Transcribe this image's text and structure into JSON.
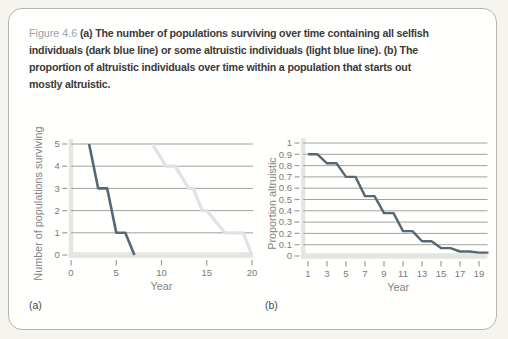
{
  "page": {
    "panel_a_label": "(a)",
    "panel_b_label": "(b)"
  },
  "caption": {
    "figure_label": "Figure 4.6",
    "lines": [
      " (a) The number of populations surviving over time containing all selfish",
      "individuals (dark blue line) or some altruistic individuals (light blue line). (b) The",
      "proportion of altruistic individuals over time within a population that starts out",
      "mostly altruistic."
    ]
  },
  "colors": {
    "page_bg": "#f6f4ee",
    "card_bg": "#fffffe",
    "card_border": "#b6b4ac",
    "caption_label": "#93a5ae",
    "caption_text": "#3b3a38",
    "dark_line": "#566874",
    "light_line": "#dde4e9",
    "grid": "#a2a2a0",
    "axis_band": "#e5e5e1",
    "tick": "#9d9d9b",
    "tick_label": "#7b7b79",
    "axis_title": "#848482"
  },
  "chart_data": [
    {
      "id": "a",
      "type": "line",
      "title": "",
      "xlabel": "Year",
      "ylabel": "Number of populations surviving",
      "xlim": [
        0,
        20
      ],
      "ylim": [
        0,
        5
      ],
      "grid": "horizontal",
      "legend": "none",
      "xticks": [
        0,
        5,
        10,
        15,
        20
      ],
      "xtick_labels": [
        "0",
        "5",
        "10",
        "15",
        "20"
      ],
      "yticks": [
        0,
        1,
        2,
        3,
        4,
        5
      ],
      "ytick_labels": [
        "0",
        "1",
        "2",
        "3",
        "4",
        "5"
      ],
      "series": [
        {
          "name": "all selfish individuals (dark blue line)",
          "key": "selfish-populations-line",
          "color_key": "dark_line",
          "stroke_width": 2.6,
          "points": [
            [
              2,
              5
            ],
            [
              3,
              3
            ],
            [
              4,
              3
            ],
            [
              5,
              1
            ],
            [
              6,
              1
            ],
            [
              7,
              0
            ]
          ]
        },
        {
          "name": "some altruistic individuals (light blue line)",
          "key": "altruistic-populations-line",
          "color_key": "light_line",
          "stroke_width": 3.2,
          "points": [
            [
              9,
              5
            ],
            [
              10.5,
              4
            ],
            [
              11.5,
              4
            ],
            [
              13,
              3
            ],
            [
              13.5,
              3
            ],
            [
              14.5,
              2
            ],
            [
              15,
              2
            ],
            [
              17,
              1
            ],
            [
              19,
              1
            ],
            [
              20,
              0
            ]
          ]
        }
      ]
    },
    {
      "id": "b",
      "type": "line",
      "title": "",
      "xlabel": "Year",
      "ylabel": "Proportion altruistic",
      "xlim": [
        1,
        20
      ],
      "ylim": [
        0,
        1
      ],
      "grid": "horizontal",
      "legend": "none",
      "xticks": [
        1,
        3,
        5,
        7,
        9,
        11,
        13,
        15,
        17,
        19
      ],
      "xtick_labels": [
        "1",
        "3",
        "5",
        "7",
        "9",
        "11",
        "13",
        "15",
        "17",
        "19"
      ],
      "yticks": [
        0,
        0.1,
        0.2,
        0.3,
        0.4,
        0.5,
        0.6,
        0.7,
        0.8,
        0.9,
        1
      ],
      "ytick_labels": [
        "0",
        "0.1",
        "0.2",
        "0.3",
        "0.4",
        "0.5",
        "0.6",
        "0.7",
        "0.8",
        "0.9",
        "1"
      ],
      "series": [
        {
          "name": "proportion altruistic within one population",
          "key": "proportion-altruistic-line",
          "color_key": "dark_line",
          "stroke_width": 2.4,
          "points": [
            [
              1,
              0.9
            ],
            [
              2,
              0.9
            ],
            [
              3,
              0.82
            ],
            [
              4,
              0.82
            ],
            [
              5,
              0.7
            ],
            [
              6,
              0.7
            ],
            [
              7,
              0.53
            ],
            [
              8,
              0.53
            ],
            [
              9,
              0.38
            ],
            [
              10,
              0.38
            ],
            [
              11,
              0.22
            ],
            [
              12,
              0.22
            ],
            [
              13,
              0.13
            ],
            [
              14,
              0.13
            ],
            [
              15,
              0.07
            ],
            [
              16,
              0.07
            ],
            [
              17,
              0.04
            ],
            [
              18,
              0.04
            ],
            [
              19,
              0.03
            ],
            [
              20,
              0.03
            ]
          ]
        }
      ]
    }
  ]
}
